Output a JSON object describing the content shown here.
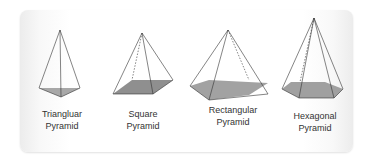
{
  "shapes": [
    {
      "name": "triangular",
      "line1": "Triangluar",
      "line2": "Pyramid"
    },
    {
      "name": "square",
      "line1": "Square",
      "line2": "Pyramid"
    },
    {
      "name": "rectangular",
      "line1": "Rectangular",
      "line2": "Pyramid"
    },
    {
      "name": "hexagonal",
      "line1": "Hexagonal",
      "line2": "Pyramid"
    }
  ],
  "colors": {
    "base_fill": "#9e9e9e",
    "stroke": "#333333"
  }
}
